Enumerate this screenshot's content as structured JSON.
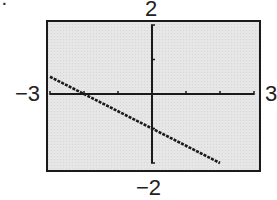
{
  "problem": {
    "number_label": "7."
  },
  "window": {
    "xmin_label": "−3",
    "xmax_label": "3",
    "ymin_label": "−2",
    "ymax_label": "2"
  },
  "colors": {
    "screen_background": "#e4e4e4",
    "border": "#1a1a1a",
    "axis": "#1a1a1a",
    "line": "#1a1a1a"
  },
  "chart_data": {
    "type": "line",
    "title": "",
    "xlabel": "",
    "ylabel": "",
    "xlim": [
      -3,
      3
    ],
    "ylim": [
      -2,
      2
    ],
    "xscale": 1,
    "yscale": 1,
    "grid": false,
    "window_labels": {
      "xmin": "−3",
      "xmax": "3",
      "ymin": "−2",
      "ymax": "2"
    },
    "series": [
      {
        "name": "y = -0.5x - 1",
        "equation": "y = -1/2 x - 1",
        "x": [
          -3,
          -2,
          -1,
          0,
          1,
          2
        ],
        "y": [
          0.5,
          0,
          -0.5,
          -1,
          -1.5,
          -2
        ]
      }
    ],
    "x_ticks": [
      -3,
      -2,
      -1,
      0,
      1,
      2,
      3
    ],
    "y_ticks": [
      -2,
      -1,
      0,
      1,
      2
    ],
    "intercepts": {
      "x": -2,
      "y": -1
    }
  }
}
